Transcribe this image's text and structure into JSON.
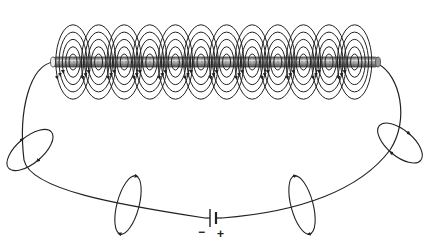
{
  "diagram": {
    "battery": {
      "negative_label": "−",
      "positive_label": "+"
    },
    "coil": {
      "field_loop_groups": 12,
      "rings_per_group": 5
    },
    "wire_field_loops": 4,
    "colors": {
      "line": "#222222",
      "rod_fill": "#9a9a9a",
      "rod_stroke": "#444444",
      "background": "#ffffff"
    }
  }
}
